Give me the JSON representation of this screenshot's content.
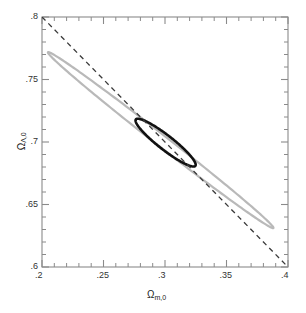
{
  "chart_data": {
    "type": "line",
    "title": "",
    "xlabel": "Ωm,0",
    "ylabel": "ΩΛ,0",
    "xlabel_base": "Ω",
    "xlabel_sub": "m,0",
    "ylabel_base": "Ω",
    "ylabel_sub": "Λ,0",
    "xlim": [
      0.2,
      0.4
    ],
    "ylim": [
      0.6,
      0.8
    ],
    "grid": false,
    "legend": "none",
    "x_ticks": [
      0.2,
      0.25,
      0.3,
      0.35,
      0.4
    ],
    "x_tick_labels": [
      ".2",
      ".25",
      ".3",
      ".35",
      ".4"
    ],
    "y_ticks": [
      0.6,
      0.65,
      0.7,
      0.75,
      0.8
    ],
    "y_tick_labels": [
      ".6",
      ".65",
      ".7",
      ".75",
      ".8"
    ],
    "minor_tick_step": 0.01,
    "series": [
      {
        "name": "outer-confidence-contour",
        "kind": "ellipse",
        "color": "#b9b9b9",
        "linewidth": 2.2,
        "linestyle": "solid",
        "center": [
          0.2965,
          0.7015
        ],
        "semi_major": 0.1155,
        "semi_minor": 0.0046,
        "angle_deg": -37.5,
        "extent_x": [
          0.205,
          0.388
        ],
        "extent_y": [
          0.631,
          0.772
        ]
      },
      {
        "name": "inner-confidence-contour",
        "kind": "ellipse",
        "color": "#111111",
        "linewidth": 2.6,
        "linestyle": "solid",
        "center": [
          0.3005,
          0.6995
        ],
        "semi_major": 0.0305,
        "semi_minor": 0.0058,
        "angle_deg": -37.5,
        "extent_x": [
          0.287,
          0.3245
        ],
        "extent_y": [
          0.6795,
          0.7135
        ]
      },
      {
        "name": "flat-universe-line",
        "kind": "line",
        "color": "#3a3a3a",
        "linewidth": 1.3,
        "linestyle": "dashed",
        "dash_pattern": "5,4",
        "points": [
          [
            0.2,
            0.8
          ],
          [
            0.4,
            0.6
          ]
        ]
      }
    ]
  },
  "figure": {
    "background": "#ffffff",
    "frame_color": "#8a8a8a",
    "tick_color": "#8a8a8a"
  }
}
